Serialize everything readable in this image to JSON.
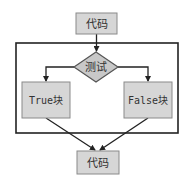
{
  "diagram": {
    "type": "flowchart",
    "colors": {
      "node_fill": "#d6d6d6",
      "node_stroke": "#8a8a8a",
      "edge": "#222222",
      "text": "#333333"
    },
    "nodes": {
      "top": {
        "label": "代码"
      },
      "decision": {
        "label": "测试"
      },
      "true_block": {
        "label": "True块"
      },
      "false_block": {
        "label": "False块"
      },
      "bottom": {
        "label": "代码"
      }
    },
    "edges": [
      {
        "from": "top",
        "to": "decision"
      },
      {
        "from": "decision",
        "to": "true_block"
      },
      {
        "from": "decision",
        "to": "false_block"
      },
      {
        "from": "true_block",
        "to": "bottom"
      },
      {
        "from": "false_block",
        "to": "bottom"
      }
    ]
  }
}
